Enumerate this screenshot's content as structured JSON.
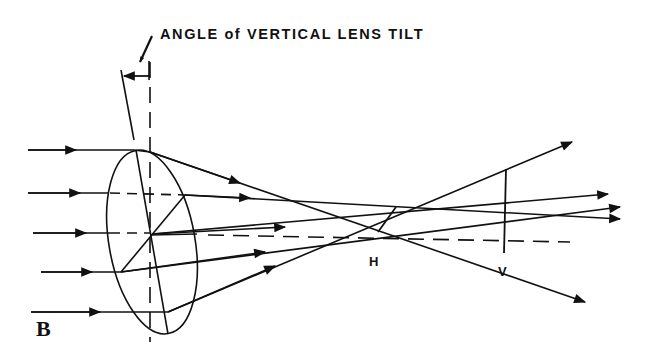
{
  "diagram": {
    "title": "ANGLE of VERTICAL LENS TILT",
    "panel_label": "B",
    "point_labels": {
      "horizontal_focus": "H",
      "vertical_focus": "V"
    },
    "elements": [
      "incoming-parallel-rays",
      "tilted-lens",
      "vertical-reference-axis",
      "tilted-lens-axis",
      "optical-axis-dashed",
      "refracted-rays",
      "horizontal-focal-line",
      "vertical-focal-line"
    ],
    "colors": {
      "line": "#111111",
      "background": "#ffffff"
    }
  }
}
